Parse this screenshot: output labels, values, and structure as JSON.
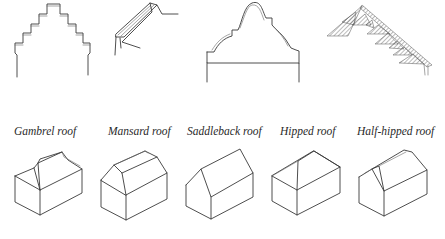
{
  "figure": {
    "top_row": {
      "description": "Gable and eaves details",
      "items": [
        {
          "id": "stepped-gable"
        },
        {
          "id": "eaves-detail"
        },
        {
          "id": "curved-gable"
        },
        {
          "id": "hatched-corbie-gable"
        }
      ]
    },
    "bottom_row": {
      "items": [
        {
          "id": "gambrel",
          "label": "Gambrel roof"
        },
        {
          "id": "mansard",
          "label": "Mansard roof"
        },
        {
          "id": "saddleback",
          "label": "Saddleback roof"
        },
        {
          "id": "hipped",
          "label": "Hipped roof"
        },
        {
          "id": "half-hipped",
          "label": "Half-hipped roof"
        }
      ]
    },
    "colors": {
      "line": "#3a3a3a",
      "background": "#ffffff"
    }
  }
}
